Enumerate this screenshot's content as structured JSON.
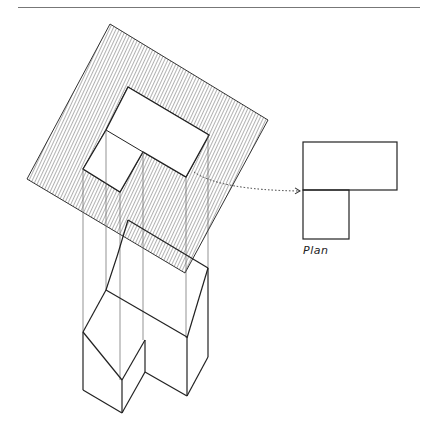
{
  "header": {
    "title": "",
    "rule": true
  },
  "figure": {
    "plan_label": "Plan",
    "hatch_color": "#555555",
    "line_color": "#222222",
    "arrow_style": "dotted"
  }
}
